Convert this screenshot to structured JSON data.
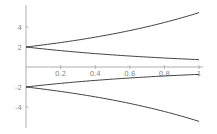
{
  "chart_data": {
    "type": "line",
    "title": "",
    "xlabel": "",
    "ylabel": "",
    "xlim": [
      0,
      1
    ],
    "ylim": [
      -6,
      6
    ],
    "grid": false,
    "legend": null,
    "x_ticks": [
      "0.2",
      "0.4",
      "0.6",
      "0.8",
      "1"
    ],
    "y_ticks": [
      "4",
      "2",
      "-2",
      "-4"
    ],
    "x": [
      0,
      0.1,
      0.2,
      0.3,
      0.4,
      0.5,
      0.6,
      0.7,
      0.8,
      0.9,
      1.0
    ],
    "series": [
      {
        "name": "2e^x",
        "values": [
          2.0,
          2.21,
          2.44,
          2.7,
          2.98,
          3.3,
          3.64,
          4.03,
          4.45,
          4.92,
          5.44
        ]
      },
      {
        "name": "2e^-x",
        "values": [
          2.0,
          1.81,
          1.64,
          1.48,
          1.34,
          1.21,
          1.1,
          0.99,
          0.9,
          0.81,
          0.74
        ]
      },
      {
        "name": "-2e^-x",
        "values": [
          -2.0,
          -1.81,
          -1.64,
          -1.48,
          -1.34,
          -1.21,
          -1.1,
          -0.99,
          -0.9,
          -0.81,
          -0.74
        ]
      },
      {
        "name": "-2e^x",
        "values": [
          -2.0,
          -2.21,
          -2.44,
          -2.7,
          -2.98,
          -3.3,
          -3.64,
          -4.03,
          -4.45,
          -4.92,
          -5.44
        ]
      }
    ],
    "colors": {
      "curve": "#444444",
      "axis": "#9a9a9a",
      "labels": "#8a8a8a"
    }
  }
}
